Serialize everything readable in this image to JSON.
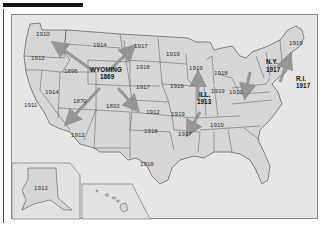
{
  "title_bar": "",
  "map": {
    "subject": "Year women gained the right to vote, by state",
    "colors": {
      "background": "#e6e6e6",
      "state_fill": "#d6d6d6",
      "border": "#555555",
      "arrow": "#8c8c8c",
      "text": "#333333"
    },
    "highlighted": [
      {
        "name": "WYOMING",
        "year": "1869"
      },
      {
        "name": "ILL.",
        "year": "1913"
      },
      {
        "name": "N.Y.",
        "year": "1917"
      },
      {
        "name": "R.I.",
        "year": "1917"
      }
    ],
    "labels": [
      {
        "state": "Washington",
        "year": "1910"
      },
      {
        "state": "Oregon",
        "year": "1912"
      },
      {
        "state": "California",
        "year": "1911"
      },
      {
        "state": "Nevada",
        "year": "1914"
      },
      {
        "state": "Idaho",
        "year": "1896"
      },
      {
        "state": "Montana",
        "year": "1914"
      },
      {
        "state": "Utah",
        "year": "1870"
      },
      {
        "state": "Arizona",
        "year": "1912"
      },
      {
        "state": "Colorado",
        "year": "1893"
      },
      {
        "state": "North Dakota",
        "year": "1917"
      },
      {
        "state": "South Dakota",
        "year": "1918"
      },
      {
        "state": "Nebraska",
        "year": "1917"
      },
      {
        "state": "Kansas",
        "year": "1912"
      },
      {
        "state": "Oklahoma",
        "year": "1918"
      },
      {
        "state": "Texas",
        "year": "1918"
      },
      {
        "state": "Minnesota",
        "year": "1919"
      },
      {
        "state": "Iowa",
        "year": "1919"
      },
      {
        "state": "Missouri",
        "year": "1919"
      },
      {
        "state": "Arkansas",
        "year": "1917"
      },
      {
        "state": "Wisconsin",
        "year": "1919"
      },
      {
        "state": "Michigan",
        "year": "1918"
      },
      {
        "state": "Indiana",
        "year": "1919"
      },
      {
        "state": "Ohio",
        "year": "1919"
      },
      {
        "state": "Tennessee",
        "year": "1919"
      },
      {
        "state": "Maine",
        "year": "1919"
      },
      {
        "state": "Alaska",
        "year": "1913"
      }
    ],
    "insets": [
      "Alaska",
      "Hawaii"
    ]
  }
}
